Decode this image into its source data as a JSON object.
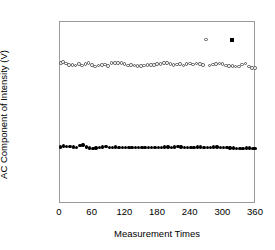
{
  "chart_data": {
    "type": "scatter",
    "title": "",
    "xlabel": "Measurement Times",
    "ylabel": "AC Component of Intensity (V)",
    "xlim": [
      0,
      360
    ],
    "ylim": [
      0.03,
      0.07
    ],
    "xticks": [
      0,
      60,
      120,
      180,
      240,
      300,
      360
    ],
    "yticks": [
      0.03,
      0.04,
      0.05,
      0.06,
      0.07
    ],
    "xtick_labels": [
      "0",
      "60",
      "120",
      "180",
      "240",
      "300",
      "360"
    ],
    "ytick_labels": [
      "0.03",
      "0.04",
      "0.05",
      "0.06",
      "0.07"
    ],
    "grid": false,
    "legend": "none",
    "series": [
      {
        "name": "open-circle-series",
        "marker": "open-circle",
        "color": "#555555",
        "points": [
          [
            2,
            0.0609
          ],
          [
            6,
            0.0612
          ],
          [
            11,
            0.0608
          ],
          [
            17,
            0.0605
          ],
          [
            23,
            0.0605
          ],
          [
            29,
            0.0604
          ],
          [
            35,
            0.0607
          ],
          [
            41,
            0.0604
          ],
          [
            47,
            0.0607
          ],
          [
            53,
            0.0609
          ],
          [
            59,
            0.0605
          ],
          [
            65,
            0.0602
          ],
          [
            71,
            0.0604
          ],
          [
            77,
            0.0605
          ],
          [
            83,
            0.0606
          ],
          [
            89,
            0.0603
          ],
          [
            95,
            0.0609
          ],
          [
            101,
            0.061
          ],
          [
            107,
            0.0609
          ],
          [
            113,
            0.061
          ],
          [
            119,
            0.0607
          ],
          [
            125,
            0.0604
          ],
          [
            131,
            0.0605
          ],
          [
            137,
            0.0604
          ],
          [
            143,
            0.0603
          ],
          [
            149,
            0.0603
          ],
          [
            155,
            0.0604
          ],
          [
            161,
            0.0605
          ],
          [
            167,
            0.0605
          ],
          [
            173,
            0.0605
          ],
          [
            179,
            0.0607
          ],
          [
            185,
            0.0607
          ],
          [
            191,
            0.0609
          ],
          [
            197,
            0.061
          ],
          [
            203,
            0.0607
          ],
          [
            209,
            0.0605
          ],
          [
            215,
            0.0606
          ],
          [
            221,
            0.0607
          ],
          [
            227,
            0.0604
          ],
          [
            233,
            0.0607
          ],
          [
            239,
            0.0608
          ],
          [
            245,
            0.0606
          ],
          [
            251,
            0.0608
          ],
          [
            257,
            0.0607
          ],
          [
            263,
            0.0605
          ],
          [
            269,
            0.0661
          ],
          [
            275,
            0.0604
          ],
          [
            281,
            0.0606
          ],
          [
            287,
            0.0607
          ],
          [
            293,
            0.0608
          ],
          [
            299,
            0.0607
          ],
          [
            305,
            0.0604
          ],
          [
            311,
            0.0603
          ],
          [
            317,
            0.0603
          ],
          [
            323,
            0.0602
          ],
          [
            329,
            0.0602
          ],
          [
            335,
            0.0606
          ],
          [
            341,
            0.0608
          ],
          [
            347,
            0.0602
          ],
          [
            353,
            0.0599
          ],
          [
            359,
            0.0598
          ]
        ]
      },
      {
        "name": "filled-circle-series",
        "marker": "filled-circle",
        "color": "#000000",
        "points": [
          [
            2,
            0.0425
          ],
          [
            7,
            0.0427
          ],
          [
            13,
            0.0426
          ],
          [
            19,
            0.0426
          ],
          [
            25,
            0.0425
          ],
          [
            31,
            0.0424
          ],
          [
            37,
            0.0428
          ],
          [
            43,
            0.0429
          ],
          [
            49,
            0.0425
          ],
          [
            55,
            0.0422
          ],
          [
            61,
            0.0421
          ],
          [
            67,
            0.0422
          ],
          [
            73,
            0.0423
          ],
          [
            79,
            0.0425
          ],
          [
            85,
            0.0426
          ],
          [
            91,
            0.0424
          ],
          [
            97,
            0.0424
          ],
          [
            103,
            0.0425
          ],
          [
            109,
            0.0424
          ],
          [
            115,
            0.0424
          ],
          [
            121,
            0.0423
          ],
          [
            127,
            0.0423
          ],
          [
            133,
            0.0423
          ],
          [
            139,
            0.0423
          ],
          [
            145,
            0.0423
          ],
          [
            151,
            0.0423
          ],
          [
            157,
            0.0423
          ],
          [
            163,
            0.0424
          ],
          [
            169,
            0.0424
          ],
          [
            175,
            0.0424
          ],
          [
            181,
            0.0424
          ],
          [
            187,
            0.0424
          ],
          [
            193,
            0.0425
          ],
          [
            199,
            0.0425
          ],
          [
            205,
            0.0424
          ],
          [
            211,
            0.0425
          ],
          [
            217,
            0.0426
          ],
          [
            223,
            0.0425
          ],
          [
            229,
            0.0424
          ],
          [
            235,
            0.0424
          ],
          [
            241,
            0.0424
          ],
          [
            247,
            0.0424
          ],
          [
            253,
            0.0425
          ],
          [
            259,
            0.0425
          ],
          [
            265,
            0.0424
          ],
          [
            271,
            0.0424
          ],
          [
            277,
            0.0424
          ],
          [
            283,
            0.0425
          ],
          [
            289,
            0.0425
          ],
          [
            295,
            0.0424
          ],
          [
            301,
            0.0423
          ],
          [
            307,
            0.0423
          ],
          [
            313,
            0.0422
          ],
          [
            319,
            0.0422
          ],
          [
            325,
            0.0421
          ],
          [
            331,
            0.0421
          ],
          [
            337,
            0.0421
          ],
          [
            343,
            0.0422
          ],
          [
            349,
            0.0422
          ],
          [
            355,
            0.0421
          ],
          [
            359,
            0.0421
          ]
        ]
      },
      {
        "name": "filled-square-outlier",
        "marker": "filled-square",
        "color": "#000000",
        "points": [
          [
            316,
            0.0661
          ]
        ]
      }
    ],
    "annotations": [
      {
        "text": "outlier open circle near 270 at 0.0661"
      },
      {
        "text": "outlier filled square near 316 at 0.0661"
      }
    ]
  },
  "axes": {
    "frame_color": "#9a9a9a",
    "text_color": "#000000"
  }
}
